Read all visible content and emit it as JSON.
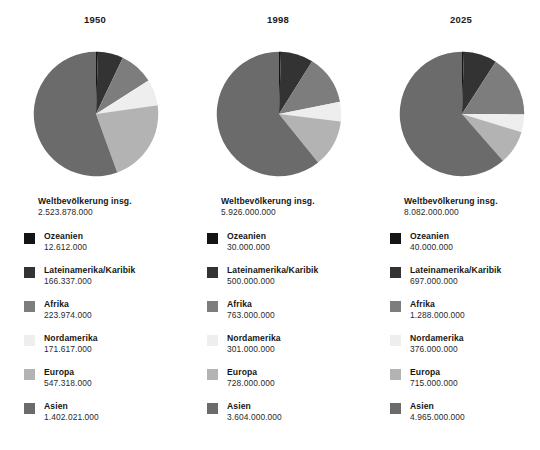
{
  "background_color": "#ffffff",
  "palette": {
    "ozeanien": "#141414",
    "lateinamerika": "#333333",
    "afrika": "#7d7d7d",
    "nordamerika": "#eeeeee",
    "europa": "#b3b3b3",
    "asien": "#6b6b6b"
  },
  "legend_order": [
    "Ozeanien",
    "Lateinamerika/Karibik",
    "Afrika",
    "Nordamerika",
    "Europa",
    "Asien"
  ],
  "total_label": "Weltbevölkerung insg.",
  "columns": [
    {
      "year": "1950",
      "total_label": "Weltbevölkerung insg.",
      "total_value": "2.523.878.000",
      "legend": [
        {
          "name": "Ozeanien",
          "value": "12.612.000"
        },
        {
          "name": "Lateinamerika/Karibik",
          "value": "166.337.000"
        },
        {
          "name": "Afrika",
          "value": "223.974.000"
        },
        {
          "name": "Nordamerika",
          "value": "171.617.000"
        },
        {
          "name": "Europa",
          "value": "547.318.000"
        },
        {
          "name": "Asien",
          "value": "1.402.021.000"
        }
      ]
    },
    {
      "year": "1998",
      "total_label": "Weltbevölkerung insg.",
      "total_value": "5.926.000.000",
      "legend": [
        {
          "name": "Ozeanien",
          "value": "30.000.000"
        },
        {
          "name": "Lateinamerika/Karibik",
          "value": "500.000.000"
        },
        {
          "name": "Afrika",
          "value": "763.000.000"
        },
        {
          "name": "Nordamerika",
          "value": "301.000.000"
        },
        {
          "name": "Europa",
          "value": "728.000.000"
        },
        {
          "name": "Asien",
          "value": "3.604.000.000"
        }
      ]
    },
    {
      "year": "2025",
      "total_label": "Weltbevölkerung insg.",
      "total_value": "8.082.000.000",
      "legend": [
        {
          "name": "Ozeanien",
          "value": "40.000.000"
        },
        {
          "name": "Lateinamerika/Karibik",
          "value": "697.000.000"
        },
        {
          "name": "Afrika",
          "value": "1.288.000.000"
        },
        {
          "name": "Nordamerika",
          "value": "376.000.000"
        },
        {
          "name": "Europa",
          "value": "715.000.000"
        },
        {
          "name": "Asien",
          "value": "4.965.000.000"
        }
      ]
    }
  ],
  "chart_data": [
    {
      "type": "pie",
      "title": "1950",
      "total": 2523878000,
      "total_label": "Weltbevölkerung insg.",
      "start_angle_deg": 0,
      "direction": "clockwise",
      "categories": [
        "Ozeanien",
        "Lateinamerika/Karibik",
        "Afrika",
        "Nordamerika",
        "Europa",
        "Asien"
      ],
      "values": [
        12612000,
        166337000,
        223974000,
        171617000,
        547318000,
        1402021000
      ],
      "percentages": [
        0.5,
        6.6,
        8.9,
        6.8,
        21.7,
        55.5
      ],
      "colors": [
        "#141414",
        "#333333",
        "#7d7d7d",
        "#eeeeee",
        "#b3b3b3",
        "#6b6b6b"
      ],
      "legend_position": "below",
      "grid": false
    },
    {
      "type": "pie",
      "title": "1998",
      "total": 5926000000,
      "total_label": "Weltbevölkerung insg.",
      "start_angle_deg": 0,
      "direction": "clockwise",
      "categories": [
        "Ozeanien",
        "Lateinamerika/Karibik",
        "Afrika",
        "Nordamerika",
        "Europa",
        "Asien"
      ],
      "values": [
        30000000,
        500000000,
        763000000,
        301000000,
        728000000,
        3604000000
      ],
      "percentages": [
        0.5,
        8.4,
        12.9,
        5.1,
        12.3,
        60.8
      ],
      "colors": [
        "#141414",
        "#333333",
        "#7d7d7d",
        "#eeeeee",
        "#b3b3b3",
        "#6b6b6b"
      ],
      "legend_position": "below",
      "grid": false
    },
    {
      "type": "pie",
      "title": "2025",
      "total": 8082000000,
      "total_label": "Weltbevölkerung insg.",
      "start_angle_deg": 0,
      "direction": "clockwise",
      "categories": [
        "Ozeanien",
        "Lateinamerika/Karibik",
        "Afrika",
        "Nordamerika",
        "Europa",
        "Asien"
      ],
      "values": [
        40000000,
        697000000,
        1288000000,
        376000000,
        715000000,
        4965000000
      ],
      "percentages": [
        0.5,
        8.6,
        15.9,
        4.7,
        8.8,
        61.4
      ],
      "colors": [
        "#141414",
        "#333333",
        "#7d7d7d",
        "#eeeeee",
        "#b3b3b3",
        "#6b6b6b"
      ],
      "legend_position": "below",
      "grid": false
    }
  ]
}
